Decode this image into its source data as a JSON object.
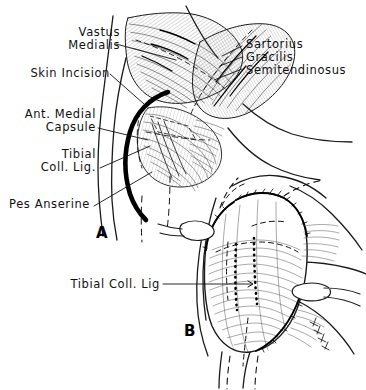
{
  "figure": {
    "background_color": "#ffffff",
    "ink_color": "#111111",
    "panels": [
      {
        "id": "A",
        "letter": "A",
        "caption": "Superficial medial exposure with skin incision"
      },
      {
        "id": "B",
        "letter": "B",
        "caption": "Deep exposure of tibial collateral ligament"
      }
    ]
  },
  "labels": {
    "vastus_medialis_line1": "Vastus",
    "vastus_medialis_line2": "Medialis",
    "skin_incision": "Skin Incision",
    "ant_medial_capsule_line1": "Ant. Medial",
    "ant_medial_capsule_line2": "Capsule",
    "tibial_coll_lig_line1": "Tibial",
    "tibial_coll_lig_line2": "Coll. Lig.",
    "pes_anserine": "Pes Anserine",
    "sartorius": "Sartorius",
    "gracilis": "Gracilis",
    "semitendinosus": "Semitendinosus",
    "tibial_coll_lig_b": "Tibial Coll. Lig",
    "panel_a_letter": "A",
    "panel_b_letter": "B"
  }
}
